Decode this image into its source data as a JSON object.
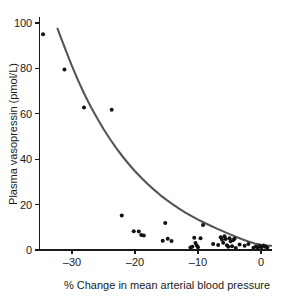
{
  "chart_data": {
    "type": "scatter",
    "title": "",
    "xlabel": "% Change in mean arterial blood pressure",
    "ylabel": "Plasma vasopressin (pmol/L)",
    "xlim": [
      -35.5,
      1.8
    ],
    "ylim": [
      -1.5,
      101
    ],
    "xticks": [
      -30,
      -20,
      -10,
      0
    ],
    "xticklabels": [
      "–30",
      "–20",
      "–10",
      "0"
    ],
    "yticks": [
      0,
      20,
      40,
      60,
      80,
      100
    ],
    "yticklabels": [
      "0",
      "20",
      "40",
      "60",
      "80",
      "100"
    ],
    "grid": false,
    "legend": null,
    "marker_color": "#111111",
    "marker_shape": "circle",
    "marker_size": 3.1,
    "curve_color": "#555555",
    "axis_color": "#1a1a1a",
    "background_color": "#ffffff",
    "points": [
      [
        -34.6,
        95.0
      ],
      [
        -31.2,
        79.5
      ],
      [
        -28.1,
        62.8
      ],
      [
        -23.7,
        61.8
      ],
      [
        -22.1,
        15.2
      ],
      [
        -20.2,
        8.3
      ],
      [
        -19.4,
        8.2
      ],
      [
        -19.0,
        6.6
      ],
      [
        -18.6,
        6.4
      ],
      [
        -15.6,
        4.1
      ],
      [
        -15.2,
        11.9
      ],
      [
        -14.8,
        5.0
      ],
      [
        -14.2,
        4.0
      ],
      [
        -11.2,
        1.1
      ],
      [
        -10.9,
        1.4
      ],
      [
        -10.6,
        5.4
      ],
      [
        -10.4,
        3.1
      ],
      [
        -10.2,
        2.0
      ],
      [
        -10.0,
        1.2
      ],
      [
        -9.6,
        5.2
      ],
      [
        -9.2,
        11.0
      ],
      [
        -7.6,
        2.6
      ],
      [
        -6.8,
        2.2
      ],
      [
        -6.4,
        5.6
      ],
      [
        -6.2,
        4.6
      ],
      [
        -6.0,
        3.2
      ],
      [
        -5.8,
        6.1
      ],
      [
        -5.6,
        4.8
      ],
      [
        -5.4,
        2.1
      ],
      [
        -5.2,
        1.4
      ],
      [
        -5.0,
        5.2
      ],
      [
        -4.8,
        3.8
      ],
      [
        -4.6,
        1.6
      ],
      [
        -4.4,
        4.4
      ],
      [
        -4.2,
        5.0
      ],
      [
        -4.0,
        0.9
      ],
      [
        -3.4,
        2.4
      ],
      [
        -2.6,
        1.9
      ],
      [
        -2.0,
        2.6
      ],
      [
        -1.2,
        1.0
      ],
      [
        -0.8,
        1.5
      ],
      [
        -0.5,
        0.9
      ],
      [
        -0.2,
        1.8
      ],
      [
        0.1,
        1.2
      ],
      [
        0.4,
        2.0
      ],
      [
        0.7,
        1.4
      ],
      [
        1.0,
        1.1
      ]
    ],
    "fit_curve": {
      "label": "exponential fit",
      "description": "Exponential decay regression line through scatter",
      "points": [
        [
          -32.3,
          97.5
        ],
        [
          -31.0,
          88.0
        ],
        [
          -30.0,
          81.0
        ],
        [
          -29.0,
          74.5
        ],
        [
          -28.0,
          68.5
        ],
        [
          -27.0,
          63.0
        ],
        [
          -26.0,
          58.0
        ],
        [
          -25.0,
          53.3
        ],
        [
          -24.0,
          49.0
        ],
        [
          -23.0,
          45.0
        ],
        [
          -22.0,
          41.3
        ],
        [
          -21.0,
          37.9
        ],
        [
          -20.0,
          34.7
        ],
        [
          -19.0,
          31.8
        ],
        [
          -18.0,
          29.1
        ],
        [
          -17.0,
          26.6
        ],
        [
          -16.0,
          24.2
        ],
        [
          -15.0,
          22.1
        ],
        [
          -14.0,
          20.1
        ],
        [
          -13.0,
          18.2
        ],
        [
          -12.0,
          16.5
        ],
        [
          -11.0,
          14.9
        ],
        [
          -10.0,
          13.4
        ],
        [
          -9.0,
          12.0
        ],
        [
          -8.0,
          10.7
        ],
        [
          -7.0,
          9.4
        ],
        [
          -6.0,
          8.2
        ],
        [
          -5.0,
          7.0
        ],
        [
          -4.0,
          5.8
        ],
        [
          -3.0,
          4.7
        ],
        [
          -2.0,
          3.7
        ],
        [
          -1.0,
          2.9
        ],
        [
          0.0,
          2.3
        ],
        [
          1.0,
          2.0
        ],
        [
          1.6,
          1.9
        ]
      ]
    }
  }
}
